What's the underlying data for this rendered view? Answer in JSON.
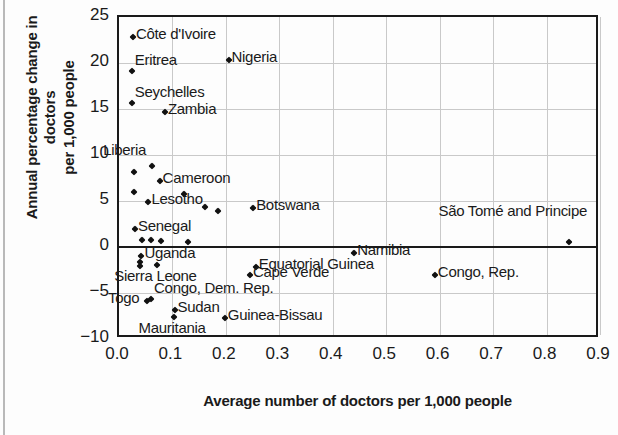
{
  "chart_data": {
    "type": "scatter",
    "title": "",
    "xlabel": "Average number of doctors per 1,000 people",
    "ylabel": "Annual percentage change in doctors per 1,000 people",
    "xlim": [
      0.0,
      0.9
    ],
    "ylim": [
      -10,
      25
    ],
    "xticks": [
      "0.0",
      "0.1",
      "0.2",
      "0.3",
      "0.4",
      "0.5",
      "0.6",
      "0.7",
      "0.8",
      "0.9"
    ],
    "xtick_values": [
      0.0,
      0.1,
      0.2,
      0.3,
      0.4,
      0.5,
      0.6,
      0.7,
      0.8,
      0.9
    ],
    "yticks": [
      "25",
      "20",
      "15",
      "10",
      "5",
      "0",
      "-5",
      "-10"
    ],
    "ytick_values": [
      25,
      20,
      15,
      10,
      5,
      0,
      -5,
      -10
    ],
    "grid": true,
    "legend": "none",
    "zero_reference_line": 0,
    "points": [
      {
        "label": "Côte d'Ivoire",
        "x": 0.026,
        "y": 22.8,
        "label_pos": "right"
      },
      {
        "label": "Nigeria",
        "x": 0.205,
        "y": 20.3,
        "label_pos": "right"
      },
      {
        "label": "Eritrea",
        "x": 0.024,
        "y": 19.1,
        "label_pos": "right-up"
      },
      {
        "label": "Seychelles",
        "x": 0.024,
        "y": 15.6,
        "label_pos": "right-up"
      },
      {
        "label": "Zambia",
        "x": 0.086,
        "y": 14.7,
        "label_pos": "right"
      },
      {
        "label": "Liberia",
        "x": 0.062,
        "y": 8.8,
        "label_pos": "left-up"
      },
      {
        "label": "",
        "x": 0.028,
        "y": 8.2,
        "label_pos": "none"
      },
      {
        "label": "Cameroon",
        "x": 0.076,
        "y": 7.2,
        "label_pos": "right"
      },
      {
        "label": "",
        "x": 0.029,
        "y": 6.0,
        "label_pos": "none"
      },
      {
        "label": "",
        "x": 0.121,
        "y": 5.8,
        "label_pos": "none"
      },
      {
        "label": "Lesotho",
        "x": 0.055,
        "y": 4.9,
        "label_pos": "right"
      },
      {
        "label": "",
        "x": 0.161,
        "y": 4.4,
        "label_pos": "none"
      },
      {
        "label": "",
        "x": 0.186,
        "y": 3.9,
        "label_pos": "none"
      },
      {
        "label": "Botswana",
        "x": 0.251,
        "y": 4.2,
        "label_pos": "right"
      },
      {
        "label": "São Tomé and Principe",
        "x": 0.842,
        "y": 0.5,
        "label_pos": "above"
      },
      {
        "label": "Senegal",
        "x": 0.03,
        "y": 2.0,
        "label_pos": "right"
      },
      {
        "label": "",
        "x": 0.043,
        "y": 0.8,
        "label_pos": "none"
      },
      {
        "label": "",
        "x": 0.06,
        "y": 0.8,
        "label_pos": "none"
      },
      {
        "label": "",
        "x": 0.078,
        "y": 0.6,
        "label_pos": "none"
      },
      {
        "label": "",
        "x": 0.13,
        "y": 0.5,
        "label_pos": "none"
      },
      {
        "label": "Namibia",
        "x": 0.44,
        "y": -0.6,
        "label_pos": "right"
      },
      {
        "label": "Uganda",
        "x": 0.042,
        "y": -1.0,
        "label_pos": "right"
      },
      {
        "label": "",
        "x": 0.04,
        "y": -1.6,
        "label_pos": "none"
      },
      {
        "label": "",
        "x": 0.04,
        "y": -2.1,
        "label_pos": "none"
      },
      {
        "label": "Sierra Leone",
        "x": 0.072,
        "y": -2.0,
        "label_pos": "below"
      },
      {
        "label": "Equatorial Guinea",
        "x": 0.256,
        "y": -2.2,
        "label_pos": "right"
      },
      {
        "label": "Cape Verde",
        "x": 0.245,
        "y": -3.0,
        "label_pos": "right"
      },
      {
        "label": "Congo, Rep.",
        "x": 0.591,
        "y": -3.0,
        "label_pos": "right"
      },
      {
        "label": "Togo",
        "x": 0.053,
        "y": -5.9,
        "label_pos": "left"
      },
      {
        "label": "Congo, Dem. Rep.",
        "x": 0.06,
        "y": -5.7,
        "label_pos": "right-up"
      },
      {
        "label": "Sudan",
        "x": 0.104,
        "y": -6.9,
        "label_pos": "right"
      },
      {
        "label": "Mauritania",
        "x": 0.103,
        "y": -7.6,
        "label_pos": "below"
      },
      {
        "label": "Guinea-Bissau",
        "x": 0.198,
        "y": -7.7,
        "label_pos": "right"
      }
    ]
  },
  "axis": {
    "x_title": "Average number of doctors per 1,000 people",
    "y_title_line1": "Annual percentage change in doctors",
    "y_title_line2": "per 1,000 people"
  }
}
